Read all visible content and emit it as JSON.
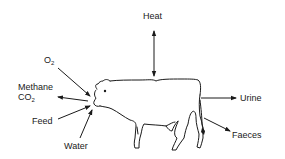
{
  "diagram": {
    "labels": {
      "heat": "Heat",
      "o2": "O",
      "o2_sub": "2",
      "methane": "Methane",
      "co2": "CO",
      "co2_sub": "2",
      "feed": "Feed",
      "water": "Water",
      "urine": "Urine",
      "faeces": "Faeces"
    },
    "flows": [
      {
        "label": "Heat",
        "direction": "bidirectional"
      },
      {
        "label": "O2",
        "direction": "in"
      },
      {
        "label": "Methane, CO2",
        "direction": "out"
      },
      {
        "label": "Feed",
        "direction": "in"
      },
      {
        "label": "Water",
        "direction": "in"
      },
      {
        "label": "Urine",
        "direction": "out"
      },
      {
        "label": "Faeces",
        "direction": "out"
      }
    ],
    "colors": {
      "ink": "#1a1a1a",
      "background": "#ffffff"
    }
  }
}
